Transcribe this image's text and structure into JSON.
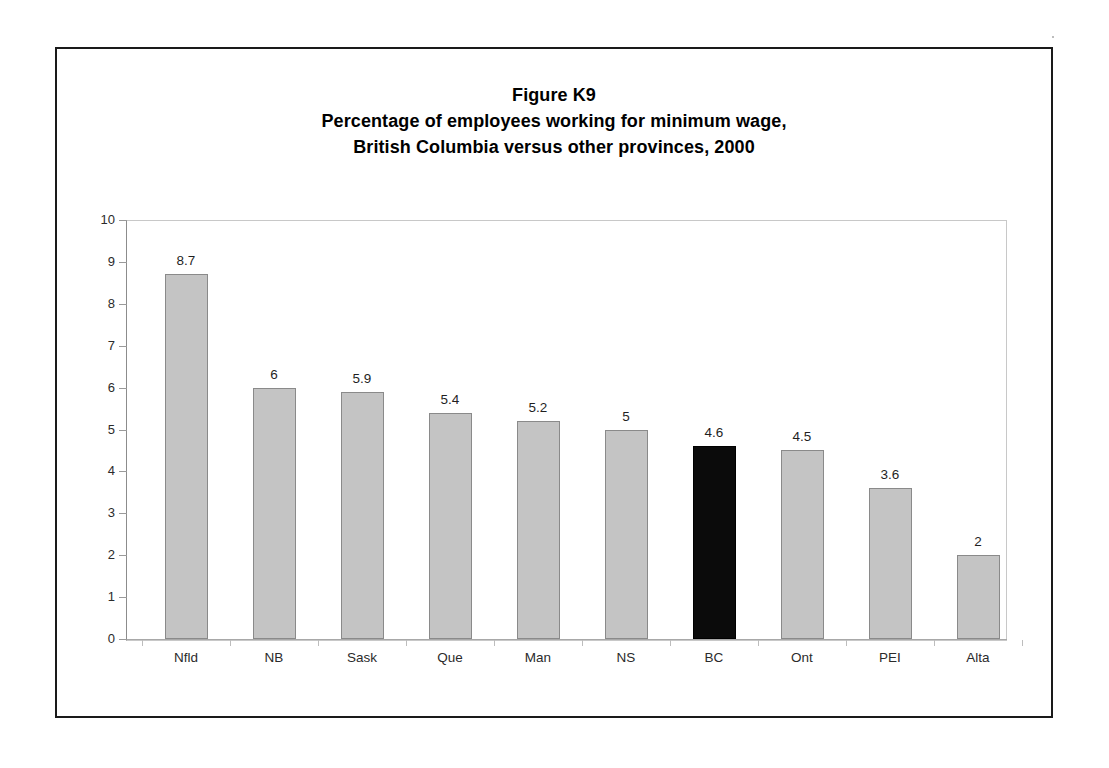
{
  "figure": {
    "title_line1": "Figure K9",
    "title_line2": "Percentage of employees working for minimum wage,",
    "title_line3": "British Columbia versus other provinces, 2000",
    "border_color": "#1a1a1a",
    "background": "#ffffff"
  },
  "axis": {
    "y_ticks": [
      "10",
      "9",
      "8",
      "7",
      "6",
      "5",
      "4",
      "3",
      "2",
      "1",
      "0"
    ],
    "y_min": 0,
    "y_max": 10,
    "y_step": 1
  },
  "chart_data": {
    "type": "bar",
    "categories": [
      "Nfld",
      "NB",
      "Sask",
      "Que",
      "Man",
      "NS",
      "BC",
      "Ont",
      "PEI",
      "Alta"
    ],
    "values": [
      8.7,
      6,
      5.9,
      5.4,
      5.2,
      5,
      4.6,
      4.5,
      3.6,
      2
    ],
    "value_labels": [
      "8.7",
      "6",
      "5.9",
      "5.4",
      "5.2",
      "5",
      "4.6",
      "4.5",
      "3.6",
      "2"
    ],
    "highlight_category": "BC",
    "highlight_index": 6,
    "bar_fill": "#c4c4c4",
    "bar_border": "#8a8a8a",
    "highlight_fill": "#0b0b0b",
    "xlabel": "",
    "ylabel": "",
    "ylim": [
      0,
      10
    ],
    "ytick_step": 1,
    "grid": false,
    "legend": false
  }
}
